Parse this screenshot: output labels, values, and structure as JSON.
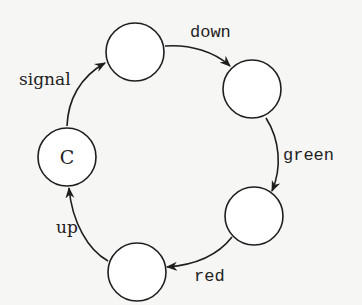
{
  "diagram": {
    "type": "state-cycle",
    "nodes": [
      {
        "id": "C",
        "label": "C",
        "cx": 34,
        "cy": 155,
        "r": 29
      },
      {
        "id": "n1",
        "label": "",
        "cx": 135,
        "cy": 52,
        "r": 29
      },
      {
        "id": "n2",
        "label": "",
        "cx": 252,
        "cy": 89,
        "r": 29
      },
      {
        "id": "n3",
        "label": "",
        "cx": 254,
        "cy": 216,
        "r": 29
      },
      {
        "id": "n4",
        "label": "",
        "cx": 137,
        "cy": 272,
        "r": 29
      }
    ],
    "edges": [
      {
        "from": "C",
        "to": "n1",
        "label": "signal"
      },
      {
        "from": "n1",
        "to": "n2",
        "label": "down"
      },
      {
        "from": "n2",
        "to": "n3",
        "label": "green"
      },
      {
        "from": "n3",
        "to": "n4",
        "label": "red"
      },
      {
        "from": "n4",
        "to": "C",
        "label": "up"
      }
    ],
    "colors": {
      "stroke": "#1e1e1e",
      "background": "#f6f6f4",
      "node_fill": "#ffffff"
    }
  }
}
